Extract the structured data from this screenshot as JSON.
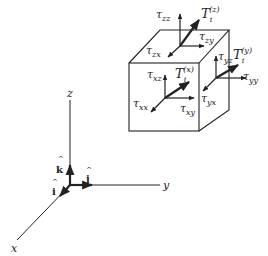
{
  "figure": {
    "type": "stress-cube-diagram",
    "axes": {
      "x_label": "x",
      "y_label": "y",
      "z_label": "z",
      "unit_i": "i",
      "unit_j": "j",
      "unit_k": "k",
      "hat": "^"
    },
    "faces": {
      "x_face": {
        "traction": {
          "base": "T",
          "sub": "i",
          "sup": "(x)"
        },
        "components": [
          {
            "base": "τ",
            "sub": "xx"
          },
          {
            "base": "τ",
            "sub": "xy"
          },
          {
            "base": "τ",
            "sub": "xz"
          }
        ]
      },
      "y_face": {
        "traction": {
          "base": "T",
          "sub": "i",
          "sup": "(y)"
        },
        "components": [
          {
            "base": "τ",
            "sub": "yx"
          },
          {
            "base": "τ",
            "sub": "yy"
          },
          {
            "base": "τ",
            "sub": "yz"
          }
        ]
      },
      "z_face": {
        "traction": {
          "base": "T",
          "sub": "i",
          "sup": "(z)"
        },
        "components": [
          {
            "base": "τ",
            "sub": "zx"
          },
          {
            "base": "τ",
            "sub": "zy"
          },
          {
            "base": "τ",
            "sub": "zz"
          }
        ]
      }
    },
    "colors": {
      "line": "#222222",
      "background": "#ffffff"
    }
  }
}
